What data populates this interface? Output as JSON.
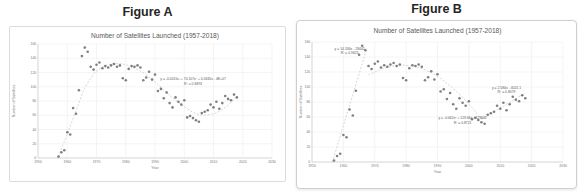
{
  "figures": [
    {
      "label": "Figure A"
    },
    {
      "label": "Figure B"
    }
  ],
  "colors": {
    "point": "#6f6f6f",
    "trendline": "#c4c4c4",
    "gridline": "#e9e9e9",
    "axis_line": "#c6c6c6",
    "chart_title_text": "#595959",
    "tick_text": "#767676",
    "annotation_text": "#595959"
  },
  "chart_data": [
    {
      "type": "scatter",
      "title": "Number of Satellites Launched (1957-2018)",
      "xlabel": "Year",
      "ylabel": "Number of Satellites",
      "xlim": [
        1950,
        2030
      ],
      "ylim": [
        0,
        160
      ],
      "xticks": [
        1950,
        1960,
        1970,
        1980,
        1990,
        2000,
        2010,
        2020,
        2030
      ],
      "yticks": [
        0,
        20,
        40,
        60,
        80,
        100,
        120,
        140,
        160
      ],
      "grid": true,
      "legend": "none",
      "years": [
        1957,
        1958,
        1959,
        1960,
        1961,
        1962,
        1963,
        1964,
        1965,
        1966,
        1967,
        1968,
        1969,
        1970,
        1971,
        1972,
        1973,
        1974,
        1975,
        1976,
        1977,
        1978,
        1979,
        1980,
        1981,
        1982,
        1983,
        1984,
        1985,
        1986,
        1987,
        1988,
        1989,
        1990,
        1991,
        1992,
        1993,
        1994,
        1995,
        1996,
        1997,
        1998,
        1999,
        2000,
        2001,
        2002,
        2003,
        2004,
        2005,
        2006,
        2007,
        2008,
        2009,
        2010,
        2011,
        2012,
        2013,
        2014,
        2015,
        2016,
        2017,
        2018
      ],
      "values": [
        2,
        8,
        11,
        36,
        33,
        70,
        62,
        95,
        143,
        155,
        149,
        128,
        124,
        131,
        134,
        126,
        129,
        127,
        130,
        132,
        128,
        130,
        112,
        109,
        125,
        129,
        128,
        130,
        127,
        109,
        113,
        121,
        110,
        117,
        94,
        97,
        84,
        92,
        77,
        71,
        85,
        79,
        75,
        81,
        57,
        59,
        56,
        53,
        51,
        63,
        65,
        67,
        75,
        71,
        79,
        69,
        77,
        87,
        83,
        81,
        89,
        85
      ],
      "trendlines": [
        {
          "name": "cubic-fit",
          "style": "dashed",
          "points": [
            [
              1957,
              2
            ],
            [
              1960,
              34
            ],
            [
              1963,
              66
            ],
            [
              1966,
              98
            ],
            [
              1970,
              122
            ],
            [
              1975,
              132
            ],
            [
              1980,
              131
            ],
            [
              1985,
              122
            ],
            [
              1990,
              107
            ],
            [
              1995,
              88
            ],
            [
              2000,
              72
            ],
            [
              2005,
              61
            ],
            [
              2010,
              62
            ],
            [
              2014,
              71
            ],
            [
              2018,
              87
            ]
          ]
        }
      ],
      "annotations": [
        {
          "x": 2003,
          "y": 109,
          "lines": [
            "y = -0.0011x³ + 70.107x² + 0.0345x - 4E+07",
            "R² = 0.8493"
          ]
        }
      ]
    },
    {
      "type": "scatter",
      "title": "Number of Satellites Launched (1957-2018)",
      "xlabel": "Year",
      "ylabel": "Number of Satellites",
      "xlim": [
        1950,
        2030
      ],
      "ylim": [
        0,
        160
      ],
      "xticks": [
        1950,
        1960,
        1970,
        1980,
        1990,
        2000,
        2010,
        2020,
        2030
      ],
      "yticks": [
        0,
        20,
        40,
        60,
        80,
        100,
        120,
        140,
        160
      ],
      "grid": true,
      "legend": "none",
      "years": [
        1957,
        1958,
        1959,
        1960,
        1961,
        1962,
        1963,
        1964,
        1965,
        1966,
        1967,
        1968,
        1969,
        1970,
        1971,
        1972,
        1973,
        1974,
        1975,
        1976,
        1977,
        1978,
        1979,
        1980,
        1981,
        1982,
        1983,
        1984,
        1985,
        1986,
        1987,
        1988,
        1989,
        1990,
        1991,
        1992,
        1993,
        1994,
        1995,
        1996,
        1997,
        1998,
        1999,
        2000,
        2001,
        2002,
        2003,
        2004,
        2005,
        2006,
        2007,
        2008,
        2009,
        2010,
        2011,
        2012,
        2013,
        2014,
        2015,
        2016,
        2017,
        2018
      ],
      "values": [
        2,
        8,
        11,
        36,
        33,
        70,
        62,
        95,
        143,
        155,
        149,
        128,
        124,
        131,
        134,
        126,
        129,
        127,
        130,
        132,
        128,
        130,
        112,
        109,
        125,
        129,
        128,
        130,
        127,
        109,
        113,
        121,
        110,
        117,
        94,
        97,
        84,
        92,
        77,
        71,
        85,
        79,
        75,
        81,
        57,
        59,
        56,
        53,
        51,
        63,
        65,
        67,
        75,
        71,
        79,
        69,
        77,
        87,
        83,
        81,
        89,
        85
      ],
      "trendlines": [
        {
          "name": "linear-fit-early",
          "style": "dashed",
          "points": [
            [
              1956.5,
              0
            ],
            [
              1967.5,
              152
            ]
          ]
        },
        {
          "name": "quadratic-fit-mid",
          "style": "dashed",
          "points": [
            [
              1968,
              116
            ],
            [
              1973,
              125
            ],
            [
              1978,
              129
            ],
            [
              1983,
              127
            ],
            [
              1988,
              119
            ],
            [
              1993,
              105
            ],
            [
              1998,
              86
            ],
            [
              2004,
              58
            ]
          ]
        },
        {
          "name": "linear-fit-late",
          "style": "dashed",
          "points": [
            [
              2004,
              57
            ],
            [
              2018,
              92
            ]
          ]
        }
      ],
      "annotations": [
        {
          "x": 1962,
          "y": 150,
          "lines": [
            "y = 14.536x - 28442",
            "R² = 0.9625"
          ]
        },
        {
          "x": 1998,
          "y": 57,
          "lines": [
            "y = -0.062x² + 123.66x - 123662",
            "R² = 0.8721"
          ]
        },
        {
          "x": 2012,
          "y": 98,
          "lines": [
            "y = 2.584x - 4021.1",
            "R² = 0.8079"
          ]
        }
      ]
    }
  ]
}
